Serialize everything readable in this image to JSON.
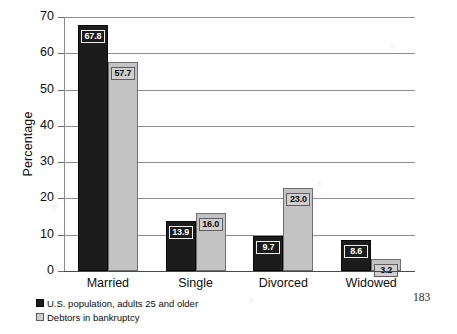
{
  "page": {
    "page_number": "183"
  },
  "chart_data": {
    "type": "bar",
    "title": "",
    "subtitle": "",
    "xlabel": "",
    "ylabel": "Percentage",
    "ylim": [
      0,
      70
    ],
    "ytick_labels": [
      "70",
      "60",
      "50",
      "40",
      "30",
      "20",
      "10",
      "0"
    ],
    "ytick_values": [
      70,
      60,
      50,
      40,
      30,
      20,
      10,
      0
    ],
    "grid": true,
    "legend_position": "bottom-left",
    "categories": [
      "Married",
      "Single",
      "Divorced",
      "Widowed"
    ],
    "series": [
      {
        "name": "U.S. population, adults 25 and older",
        "color": "#1c1c1c",
        "values": [
          67.8,
          13.9,
          9.7,
          8.6
        ],
        "value_labels": [
          "67.8",
          "13.9",
          "9.7",
          "8.6"
        ]
      },
      {
        "name": "Debtors in bankruptcy",
        "color": "#c3c3c3",
        "values": [
          57.7,
          16.0,
          23.0,
          3.2
        ],
        "value_labels": [
          "57.7",
          "16.0",
          "23.0",
          "3.2"
        ]
      }
    ]
  }
}
